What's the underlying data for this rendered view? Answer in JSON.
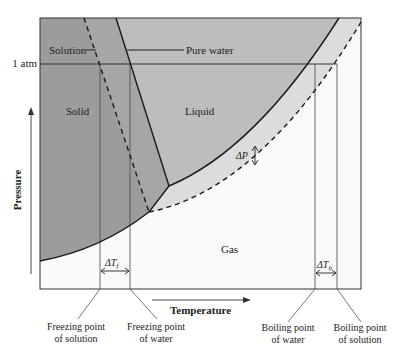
{
  "diagram": {
    "axes": {
      "x_label": "Temperature",
      "y_label": "Pressure",
      "pressure_ref": "1 atm"
    },
    "regions": {
      "solid": "Solid",
      "liquid": "Liquid",
      "gas": "Gas"
    },
    "callouts": {
      "solution": "Solution",
      "pure_water": "Pure water"
    },
    "deltas": {
      "dp": "ΔP",
      "dtf": "ΔT",
      "dtf_sub": "f",
      "dtb": "ΔT",
      "dtb_sub": "b"
    },
    "annotations": {
      "fp_solution_1": "Freezing point",
      "fp_solution_2": "of solution",
      "fp_water_1": "Freezing point",
      "fp_water_2": "of water",
      "bp_water_1": "Boiling point",
      "bp_water_2": "of water",
      "bp_solution_1": "Boiling point",
      "bp_solution_2": "of solution"
    },
    "colors": {
      "solid": "#a6a6a6",
      "liquid": "#bdbdbd",
      "band": "#dcdcdc",
      "gas": "#fafafa",
      "line": "#1a1a1a"
    }
  }
}
